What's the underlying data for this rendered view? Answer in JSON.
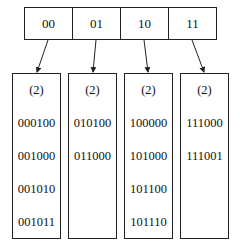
{
  "directory": {
    "entries": [
      "00",
      "01",
      "10",
      "11"
    ]
  },
  "buckets": [
    {
      "depth": "(2)",
      "keys": [
        "000100",
        "001000",
        "001010",
        "001011"
      ]
    },
    {
      "depth": "(2)",
      "keys": [
        "010100",
        "011000"
      ]
    },
    {
      "depth": "(2)",
      "keys": [
        "100000",
        "101000",
        "101100",
        "101110"
      ]
    },
    {
      "depth": "(2)",
      "keys": [
        "111000",
        "111001"
      ]
    }
  ],
  "colors": {
    "stroke": "#222222",
    "background": "#ffffff"
  }
}
